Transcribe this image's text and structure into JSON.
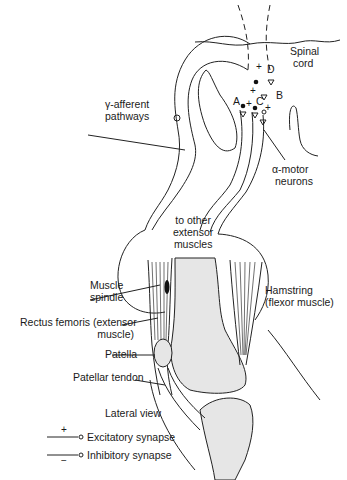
{
  "figure": {
    "view_label": "Lateral view",
    "labels": {
      "spinal_cord": [
        "Spinal",
        "cord"
      ],
      "gamma_afferent": [
        "γ-afferent",
        "pathways"
      ],
      "alpha_motor": [
        "α-motor",
        "neurons"
      ],
      "to_other_extensor": [
        "to other",
        "extensor",
        "muscles"
      ],
      "muscle_spindle": [
        "Muscle",
        "spindle"
      ],
      "rectus_femoris": [
        "Rectus femoris (extensor",
        "muscle)"
      ],
      "patella": "Patella",
      "patellar_tendon": "Patellar tendon",
      "hamstring": [
        "Hamstring",
        "(flexor muscle)"
      ]
    },
    "neuron_markers": {
      "A": "A",
      "B": "B",
      "C": "C",
      "D": "D",
      "plus": "+"
    },
    "legend": {
      "excitatory": {
        "sign": "+",
        "label": "Excitatory synapse"
      },
      "inhibitory": {
        "sign": "−",
        "label": "Inhibitory synapse"
      }
    }
  }
}
